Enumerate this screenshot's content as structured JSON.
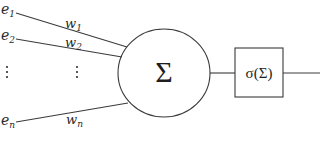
{
  "diagram": {
    "type": "perceptron",
    "inputs": [
      {
        "label": "e",
        "sub": "1",
        "weight": "w",
        "weight_sub": "1"
      },
      {
        "label": "e",
        "sub": "2",
        "weight": "w",
        "weight_sub": "2"
      },
      {
        "label": "e",
        "sub": "n",
        "weight": "w",
        "weight_sub": "n"
      }
    ],
    "ellipsis": "⋮",
    "summation": {
      "symbol": "Σ"
    },
    "activation": {
      "label": "σ(Σ)"
    },
    "colors": {
      "stroke": "#3a3a3a",
      "text": "#2a2a2a",
      "background": "#ffffff"
    }
  }
}
